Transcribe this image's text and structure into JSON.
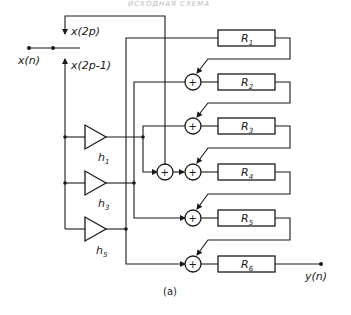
{
  "header": {
    "faint_text": "ИСХОДНАЯ СХЕМА"
  },
  "diagram": {
    "input_label": "x(n)",
    "branch_even_label": "x(2p)",
    "branch_odd_label": "x(2p-1)",
    "output_label": "y(n)",
    "caption": "(a)",
    "multipliers": [
      {
        "base": "h",
        "sub": "1"
      },
      {
        "base": "h",
        "sub": "3"
      },
      {
        "base": "h",
        "sub": "5"
      }
    ],
    "registers": [
      {
        "base": "R",
        "sub": "1"
      },
      {
        "base": "R",
        "sub": "2"
      },
      {
        "base": "R",
        "sub": "3"
      },
      {
        "base": "R",
        "sub": "4"
      },
      {
        "base": "R",
        "sub": "5"
      },
      {
        "base": "R",
        "sub": "6"
      }
    ],
    "adder_symbol": "+",
    "colors": {
      "ink": "#1a1a1a",
      "background": "#ffffff"
    }
  }
}
